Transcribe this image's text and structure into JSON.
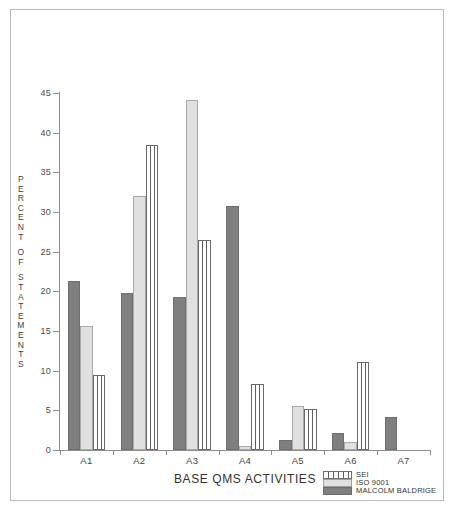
{
  "chart_data": {
    "type": "bar",
    "title": "",
    "xlabel": "BASE QMS ACTIVITIES",
    "ylabel": "PERCENT OF STATEMENTS",
    "categories": [
      "A1",
      "A2",
      "A3",
      "A4",
      "A5",
      "A6",
      "A7"
    ],
    "ylim": [
      0,
      45
    ],
    "yticks": [
      0,
      5,
      10,
      15,
      20,
      25,
      30,
      35,
      40,
      45
    ],
    "grid": false,
    "legend_position": "bottom-right",
    "series": [
      {
        "name": "MALCOLM BALDRIGE",
        "color": "#7f7f7f",
        "pattern": "solid-dark",
        "values": [
          21.3,
          19.8,
          19.3,
          30.7,
          1.2,
          2.2,
          4.2
        ]
      },
      {
        "name": "ISO 9001",
        "color": "#e0e0e0",
        "pattern": "solid-light",
        "values": [
          15.6,
          32.0,
          44.1,
          0.5,
          5.6,
          1.0,
          0.0
        ]
      },
      {
        "name": "SEI",
        "color": "#ffffff",
        "pattern": "vertical-hatch",
        "values": [
          9.5,
          38.5,
          26.5,
          8.3,
          5.2,
          11.1,
          0.0
        ]
      }
    ]
  },
  "axis": {
    "y_label_letters": [
      "P",
      "E",
      "R",
      "C",
      "E",
      "N",
      "T",
      "",
      "O",
      "F",
      "",
      "S",
      "T",
      "A",
      "T",
      "E",
      "M",
      "E",
      "N",
      "T",
      "S"
    ],
    "y_tick_labels": [
      "45",
      "40",
      "35",
      "30",
      "25",
      "20",
      "15",
      "10",
      "5",
      "0"
    ],
    "x_title": "BASE QMS ACTIVITIES"
  },
  "legend": {
    "items": [
      {
        "label": "SEI",
        "key": "sei"
      },
      {
        "label": "ISO 9001",
        "key": "iso"
      },
      {
        "label": "MALCOLM BALDRIGE",
        "key": "baldrige"
      }
    ]
  }
}
